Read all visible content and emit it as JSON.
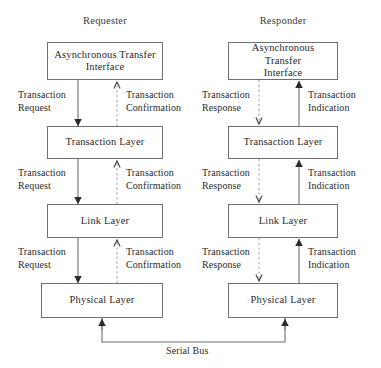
{
  "diagram": {
    "bus_label": "Serial Bus",
    "colors": {
      "box_border": "#6f6f6f",
      "solid_line": "#6f6f6f",
      "dashed_line": "#9a9a9a",
      "arrow_fill": "#2b2b2b",
      "text": "#2b2b2b",
      "background": "#ffffff"
    },
    "columns": [
      {
        "id": "requester",
        "header": "Requester",
        "down_flow_label_line1": "Transaction",
        "down_flow_label_line2": "Request",
        "up_flow_label_line1": "Transaction",
        "up_flow_label_line2": "Confirmation",
        "down_flow_style": "solid",
        "up_flow_style": "dashed"
      },
      {
        "id": "responder",
        "header": "Responder",
        "down_flow_label_line1": "Transaction",
        "down_flow_label_line2": "Response",
        "up_flow_label_line1": "Transaction",
        "up_flow_label_line2": "Indication",
        "down_flow_style": "dashed",
        "up_flow_style": "solid"
      }
    ],
    "layers": [
      {
        "id": "ati",
        "line1": "Asynchronous Transfer",
        "line2": "Interface"
      },
      {
        "id": "txn",
        "line1": "Transaction Layer",
        "line2": ""
      },
      {
        "id": "link",
        "line1": "Link Layer",
        "line2": ""
      },
      {
        "id": "physical",
        "line1": "Physical Layer",
        "line2": ""
      }
    ],
    "edges": [
      {
        "from": "ati",
        "to": "txn",
        "column": "requester",
        "down": "Transaction Request",
        "up": "Transaction Confirmation"
      },
      {
        "from": "txn",
        "to": "link",
        "column": "requester",
        "down": "Transaction Request",
        "up": "Transaction Confirmation"
      },
      {
        "from": "link",
        "to": "physical",
        "column": "requester",
        "down": "Transaction Request",
        "up": "Transaction Confirmation"
      },
      {
        "from": "ati",
        "to": "txn",
        "column": "responder",
        "down": "Transaction Response",
        "up": "Transaction Indication"
      },
      {
        "from": "txn",
        "to": "link",
        "column": "responder",
        "down": "Transaction Response",
        "up": "Transaction Indication"
      },
      {
        "from": "link",
        "to": "physical",
        "column": "responder",
        "down": "Transaction Response",
        "up": "Transaction Indication"
      }
    ]
  }
}
